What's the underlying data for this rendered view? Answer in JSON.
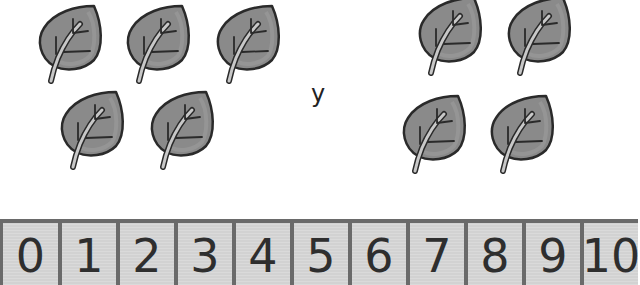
{
  "groups": [
    {
      "name": "left-group",
      "count": 5,
      "leaves": [
        {
          "x": 36,
          "y": 2
        },
        {
          "x": 124,
          "y": 2
        },
        {
          "x": 214,
          "y": 2
        },
        {
          "x": 58,
          "y": 88
        },
        {
          "x": 148,
          "y": 88
        }
      ]
    },
    {
      "name": "right-group",
      "count": 4,
      "leaves": [
        {
          "x": 416,
          "y": -6
        },
        {
          "x": 505,
          "y": -6
        },
        {
          "x": 400,
          "y": 92
        },
        {
          "x": 488,
          "y": 92
        }
      ]
    }
  ],
  "conjunction": "y",
  "number_line": {
    "numbers": [
      "0",
      "1",
      "2",
      "3",
      "4",
      "5",
      "6",
      "7",
      "8",
      "9",
      "10"
    ]
  },
  "colors": {
    "leaf_fill": "#8a8a8a",
    "leaf_outline": "#2a2a2a",
    "stem": "#c8c8c8",
    "cell_fill": "#d2d2d2",
    "cell_border": "#6a6a6a",
    "digit": "#2e2e2e"
  }
}
